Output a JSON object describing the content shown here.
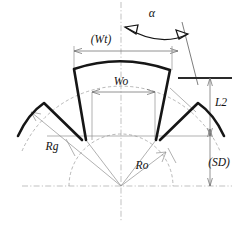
{
  "diagram": {
    "background_color": "#ffffff",
    "profile_color": "#161616",
    "reference_color": "#8f8f8f",
    "centerline_color": "#a8a8a8",
    "labels": {
      "alpha": "α",
      "wt": "(Wt)",
      "wo": "Wo",
      "l2": "L2",
      "sd": "(SD)",
      "rg": "Rg",
      "ro": "Ro"
    },
    "dimension_list": [
      {
        "symbol": "α",
        "kind": "angle",
        "placement": "top-center-right"
      },
      {
        "symbol": "(Wt)",
        "kind": "horizontal-width",
        "placement": "upper"
      },
      {
        "symbol": "Wo",
        "kind": "horizontal-width",
        "placement": "inner"
      },
      {
        "symbol": "L2",
        "kind": "vertical-height",
        "placement": "right-upper"
      },
      {
        "symbol": "(SD)",
        "kind": "vertical-height",
        "placement": "right-lower"
      },
      {
        "symbol": "Rg",
        "kind": "radius",
        "placement": "lower-left"
      },
      {
        "symbol": "Ro",
        "kind": "radius",
        "placement": "lower-center-right"
      }
    ],
    "geometry_notes": {
      "origin_x": 121,
      "origin_y": 186,
      "inner_arc_radius": 52,
      "vertical_centerline_x": 121,
      "horizontal_centerline_y": 186
    }
  }
}
